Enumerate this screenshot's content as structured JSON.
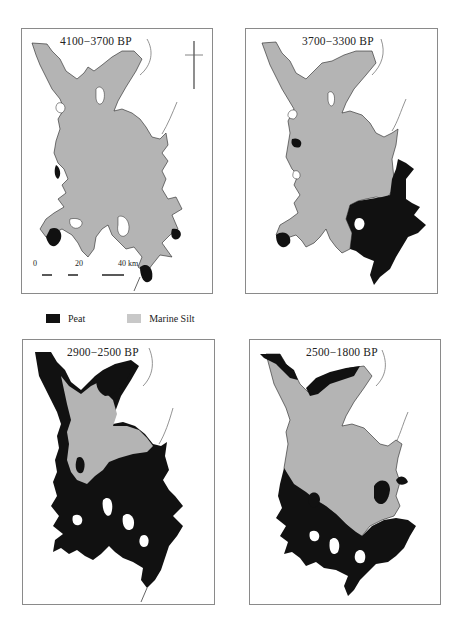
{
  "figure": {
    "panels": [
      {
        "id": "p1",
        "title": "4100−3700 BP",
        "has_north_arrow": true,
        "has_scale_bar": true,
        "peat_extent": "minor, small patches along western and southern margins"
      },
      {
        "id": "p2",
        "title": "3700−3300 BP",
        "has_north_arrow": false,
        "has_scale_bar": false,
        "peat_extent": "southeastern basin filled with peat"
      },
      {
        "id": "p3",
        "title": "2900−2500 BP",
        "has_north_arrow": false,
        "has_scale_bar": false,
        "peat_extent": "entire southern half and western margins peat; northeastern bay peat"
      },
      {
        "id": "p4",
        "title": "2500−1800 BP",
        "has_north_arrow": false,
        "has_scale_bar": false,
        "peat_extent": "southern and western margins peat, central basin marine silt"
      }
    ],
    "legend": [
      {
        "label": "Peat",
        "color": "#111111"
      },
      {
        "label": "Marine Silt",
        "color": "#c8c8c8"
      }
    ],
    "scale_bar": {
      "labels": [
        "0",
        "20",
        "40 km"
      ]
    },
    "colors": {
      "peat": "#111111",
      "marine_silt": "#b4b4b4",
      "frame": "#8a8a8a",
      "coast_line": "#777777"
    }
  }
}
